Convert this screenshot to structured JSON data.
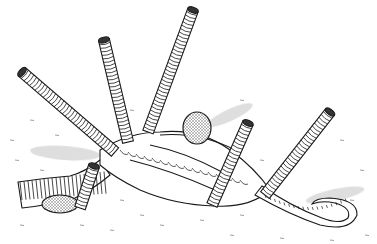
{
  "illustration": {
    "subject": "Segmented worm tubes emerging from sediment with a stippled egg capsule",
    "style": "black ink line drawing with grey wash shadows",
    "colors": {
      "ink": "#1a1a1a",
      "paper": "#ffffff",
      "shadow": "#d9d9d9",
      "stipple": "#9a9a9a"
    },
    "elements": [
      "tube-far-left",
      "tube-left-center",
      "tube-tall-center",
      "tube-right-center",
      "tube-far-right",
      "tube-short-left",
      "basal-mass",
      "curled-tail",
      "broken-stump",
      "egg-capsule"
    ]
  }
}
